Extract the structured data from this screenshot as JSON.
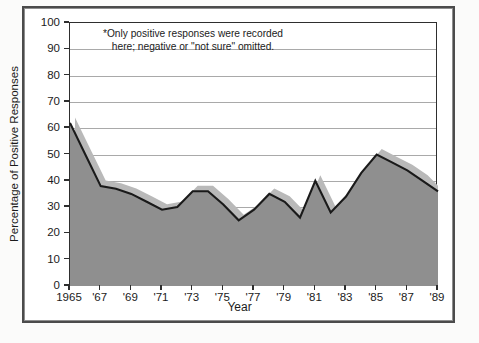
{
  "figure": {
    "annotation_line1": "*Only positive responses were recorded",
    "annotation_line2": "here; negative or \"not sure\" omitted.",
    "y_axis_title": "Percentage of Positive Responses",
    "x_axis_title": "Year"
  },
  "chart_data": {
    "type": "area",
    "title": "",
    "subtitle": "",
    "xlabel": "Year",
    "ylabel": "Percentage of Positive Responses",
    "xlim": [
      1965,
      1989
    ],
    "ylim": [
      0,
      100
    ],
    "grid": true,
    "legend_position": "none",
    "annotations": [
      "*Only positive responses were recorded here; negative or \"not sure\" omitted."
    ],
    "x_tick_labels": [
      "1965",
      "'67",
      "'69",
      "'71",
      "'73",
      "'75",
      "'77",
      "'79",
      "'81",
      "'83",
      "'85",
      "'87",
      "'89"
    ],
    "x_tick_values": [
      1965,
      1967,
      1969,
      1971,
      1973,
      1975,
      1977,
      1979,
      1981,
      1983,
      1985,
      1987,
      1989
    ],
    "y_tick_labels": [
      "0",
      "10",
      "20",
      "30",
      "40",
      "50",
      "60",
      "70",
      "80",
      "90",
      "100"
    ],
    "y_tick_values": [
      0,
      10,
      20,
      30,
      40,
      50,
      60,
      70,
      80,
      90,
      100
    ],
    "x": [
      1965,
      1966,
      1967,
      1968,
      1969,
      1970,
      1971,
      1972,
      1973,
      1974,
      1975,
      1976,
      1977,
      1978,
      1979,
      1980,
      1981,
      1982,
      1983,
      1984,
      1985,
      1986,
      1987,
      1988,
      1989
    ],
    "series": [
      {
        "name": "Percentage of positive responses",
        "values": [
          62,
          50,
          38,
          37,
          35,
          32,
          29,
          30,
          36,
          36,
          31,
          25,
          29,
          35,
          32,
          26,
          40,
          28,
          34,
          43,
          50,
          47,
          44,
          40,
          36
        ]
      }
    ],
    "style": {
      "line_color": "#1a1a1a",
      "fill_color": "#8f8f8f",
      "shadow_color": "#b9b9b9",
      "gridline_color": "#a9a9a9",
      "background": "#ffffff"
    }
  },
  "colors": {
    "line": "#1a1a1a",
    "area_fill": "#8f8f8f",
    "shadow": "#b9b9b9",
    "frame": "#4b4b4b"
  }
}
